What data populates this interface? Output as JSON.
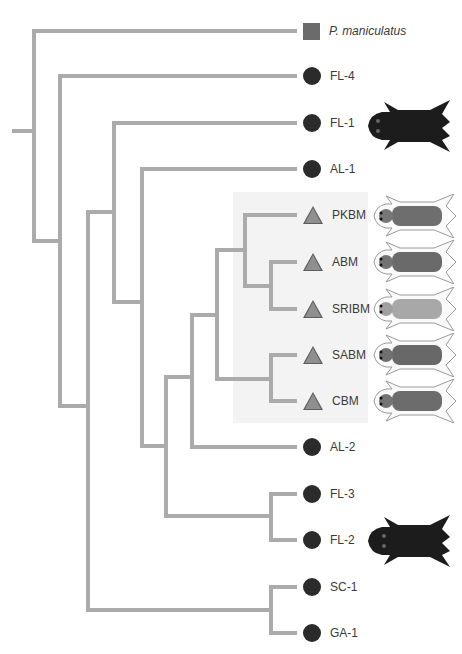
{
  "figure": {
    "type": "phylogenetic-tree",
    "branch_color": "#ababab",
    "highlight_clade_color": "#f3f3f3"
  },
  "legend_shapes": {
    "square": {
      "meaning": "outgroup",
      "color": "#6b6b6b"
    },
    "circle": {
      "color": "#2b2b2b"
    },
    "triangle": {
      "color": "#8f8f8f"
    }
  },
  "taxa": [
    {
      "label": "P. maniculatus",
      "shape": "square",
      "italic": true,
      "y": 31
    },
    {
      "label": "FL-4",
      "shape": "circle",
      "y": 76
    },
    {
      "label": "FL-1",
      "shape": "circle",
      "y": 123,
      "pelt": "dark"
    },
    {
      "label": "AL-1",
      "shape": "circle",
      "y": 169
    },
    {
      "label": "PKBM",
      "shape": "triangle",
      "y": 215,
      "pelt": "light"
    },
    {
      "label": "ABM",
      "shape": "triangle",
      "y": 262,
      "pelt": "light"
    },
    {
      "label": "SRIBM",
      "shape": "triangle",
      "y": 309,
      "pelt": "pale"
    },
    {
      "label": "SABM",
      "shape": "triangle",
      "y": 355,
      "pelt": "light"
    },
    {
      "label": "CBM",
      "shape": "triangle",
      "y": 401,
      "pelt": "light"
    },
    {
      "label": "AL-2",
      "shape": "circle",
      "y": 447
    },
    {
      "label": "FL-3",
      "shape": "circle",
      "y": 494
    },
    {
      "label": "FL-2",
      "shape": "circle",
      "y": 540,
      "pelt": "dark"
    },
    {
      "label": "SC-1",
      "shape": "circle",
      "y": 587
    },
    {
      "label": "GA-1",
      "shape": "circle",
      "y": 633
    }
  ],
  "labels": {
    "t0": "P. maniculatus",
    "t1": "FL-4",
    "t2": "FL-1",
    "t3": "AL-1",
    "t4": "PKBM",
    "t5": "ABM",
    "t6": "SRIBM",
    "t7": "SABM",
    "t8": "CBM",
    "t9": "AL-2",
    "t10": "FL-3",
    "t11": "FL-2",
    "t12": "SC-1",
    "t13": "GA-1"
  },
  "highlighted_clade": [
    "PKBM",
    "ABM",
    "SRIBM",
    "SABM",
    "CBM"
  ]
}
